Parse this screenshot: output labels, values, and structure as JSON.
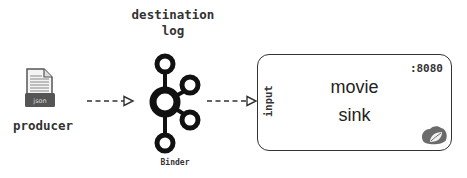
{
  "diagram": {
    "destination": {
      "title_line1": "destination",
      "title_line2": "log"
    },
    "producer": {
      "label": "producer",
      "file_badge": "json",
      "icon": "json-file-icon"
    },
    "binder": {
      "label": "Binder",
      "icon": "kafka-logo-icon"
    },
    "sink": {
      "name_line1": "movie",
      "name_line2": "sink",
      "port": ":8080",
      "input_label": "input",
      "icon": "spring-logo-icon"
    },
    "edges": [
      {
        "from": "producer",
        "to": "binder",
        "style": "dashed",
        "arrowhead": "open-triangle"
      },
      {
        "from": "binder",
        "to": "sink.input",
        "style": "dashed",
        "arrowhead": "open-triangle"
      }
    ],
    "colors": {
      "stroke": "#222222",
      "text": "#333333",
      "logo_gray": "#6b6b6b",
      "background": "#ffffff"
    }
  }
}
